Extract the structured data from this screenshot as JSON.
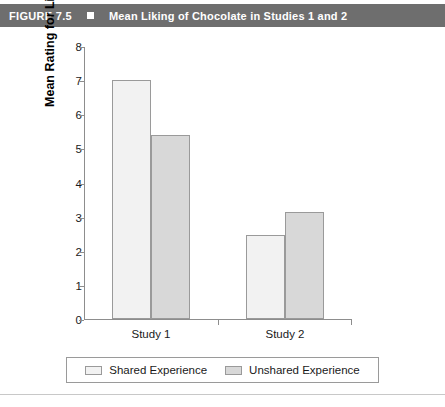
{
  "figure": {
    "number": "FIGURE 7.5",
    "bullet_icon": "square-bullet-icon",
    "title": "Mean Liking of Chocolate in Studies 1 and 2"
  },
  "chart_data": {
    "type": "bar",
    "title": "Mean Liking of Chocolate in Studies 1 and 2",
    "xlabel": "",
    "ylabel": "Mean Rating for Liking of Chocolate",
    "categories": [
      "Study 1",
      "Study 2"
    ],
    "series": [
      {
        "name": "Shared Experience",
        "values": [
          7.0,
          2.45
        ],
        "color": "#f2f2f2"
      },
      {
        "name": "Unshared Experience",
        "values": [
          5.4,
          3.15
        ],
        "color": "#d8d8d8"
      }
    ],
    "ylim": [
      0,
      8
    ],
    "yticks": [
      0,
      1,
      2,
      3,
      4,
      5,
      6,
      7,
      8
    ],
    "ytick_labels": [
      "0",
      "1",
      "2",
      "3",
      "4",
      "5",
      "6",
      "7",
      "8"
    ],
    "grid": false,
    "legend_position": "bottom"
  },
  "legend": {
    "items": [
      {
        "label": "Shared Experience",
        "swatch": "legend-swatch-shared"
      },
      {
        "label": "Unshared Experience",
        "swatch": "legend-swatch-unshared"
      }
    ]
  },
  "colors": {
    "header_background": "#6e6e6e",
    "header_text": "#ffffff",
    "axis": "#8d8d8d",
    "bar_border": "#9a9a9a",
    "shared_bar": "#f2f2f2",
    "unshared_bar": "#d8d8d8",
    "rule": "#c8c8c8"
  }
}
